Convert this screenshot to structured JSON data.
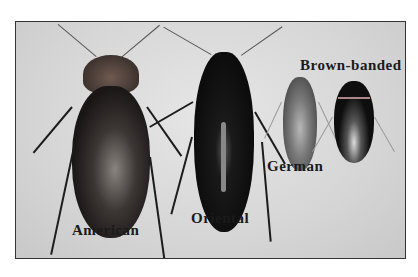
{
  "image": {
    "description": "Comparison photo of four cockroach species on light background",
    "labels": {
      "american": "American",
      "oriental": "Oriental",
      "german": "German",
      "brown_banded": "Brown-banded"
    }
  }
}
